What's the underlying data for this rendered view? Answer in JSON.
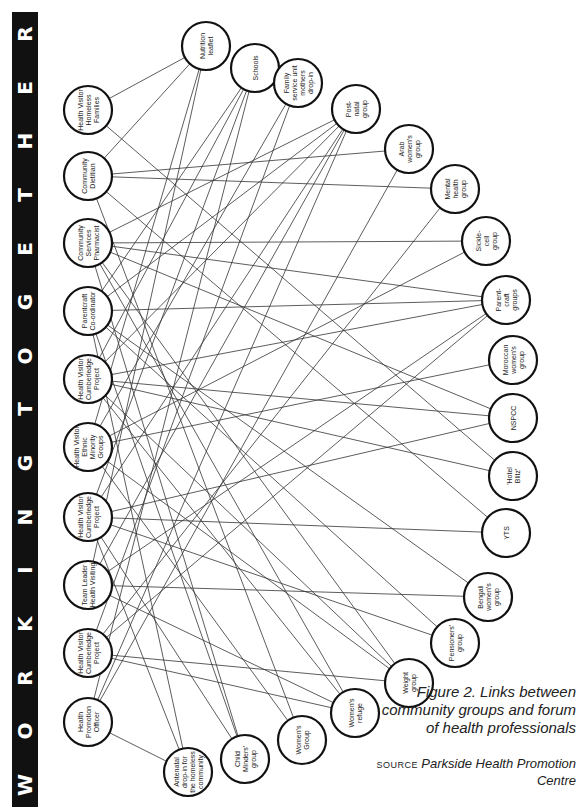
{
  "banner": {
    "title": "WORKING TOGETHER",
    "letters": [
      "W",
      "O",
      "R",
      "K",
      "I",
      "N",
      "G",
      "T",
      "O",
      "G",
      "E",
      "T",
      "H",
      "E",
      "R"
    ],
    "background": "#111111",
    "color": "#ffffff"
  },
  "diagram": {
    "professionals": [
      {
        "id": "p1",
        "label": [
          "Health Visitor",
          "Homeless",
          "Families"
        ],
        "x": 88,
        "y": 110
      },
      {
        "id": "p2",
        "label": [
          "Community",
          "Dietitian"
        ],
        "x": 88,
        "y": 176
      },
      {
        "id": "p3",
        "label": [
          "Community",
          "Services",
          "Pharmacist"
        ],
        "x": 88,
        "y": 243
      },
      {
        "id": "p4",
        "label": [
          "Parentcraft",
          "Co-ordinator"
        ],
        "x": 88,
        "y": 311
      },
      {
        "id": "p5",
        "label": [
          "Health Visitor",
          "Cumberledge",
          "Project"
        ],
        "x": 88,
        "y": 379
      },
      {
        "id": "p6",
        "label": [
          "Health Visitor",
          "Ethnic",
          "Minority",
          "Groups"
        ],
        "x": 88,
        "y": 447
      },
      {
        "id": "p7",
        "label": [
          "Health Visitor",
          "Cumberledge",
          "Project"
        ],
        "x": 88,
        "y": 517
      },
      {
        "id": "p8",
        "label": [
          "Team Leader",
          "Health Visiting"
        ],
        "x": 88,
        "y": 585
      },
      {
        "id": "p9",
        "label": [
          "Health Visitor",
          "Cumberledge",
          "Project"
        ],
        "x": 88,
        "y": 653
      },
      {
        "id": "p10",
        "label": [
          "Health",
          "Promotion",
          "Officer"
        ],
        "x": 88,
        "y": 722
      }
    ],
    "groups": [
      {
        "id": "g1",
        "label": [
          "Nutrition",
          "leaflet"
        ],
        "x": 206,
        "y": 46
      },
      {
        "id": "g2",
        "label": [
          "Schools"
        ],
        "x": 255,
        "y": 68
      },
      {
        "id": "g3",
        "label": [
          "Family",
          "service unit",
          "mothers",
          "drop-in"
        ],
        "x": 298,
        "y": 83
      },
      {
        "id": "g4",
        "label": [
          "Post-",
          "natal",
          "group"
        ],
        "x": 356,
        "y": 109
      },
      {
        "id": "g5",
        "label": [
          "Arab",
          "women's",
          "group"
        ],
        "x": 409,
        "y": 149
      },
      {
        "id": "g6",
        "label": [
          "Mental",
          "health",
          "group"
        ],
        "x": 455,
        "y": 189
      },
      {
        "id": "g7",
        "label": [
          "Sickle-",
          "cell",
          "group"
        ],
        "x": 486,
        "y": 241
      },
      {
        "id": "g8",
        "label": [
          "Parent-",
          "craft",
          "groups"
        ],
        "x": 506,
        "y": 300
      },
      {
        "id": "g9",
        "label": [
          "Moroccan",
          "women's",
          "group"
        ],
        "x": 513,
        "y": 360
      },
      {
        "id": "g10",
        "label": [
          "NSPCC"
        ],
        "x": 513,
        "y": 418
      },
      {
        "id": "g11",
        "label": [
          "'Hotel",
          "Blitz'"
        ],
        "x": 513,
        "y": 476
      },
      {
        "id": "g12",
        "label": [
          "YTS"
        ],
        "x": 506,
        "y": 533
      },
      {
        "id": "g13",
        "label": [
          "Bengali",
          "women's",
          "group"
        ],
        "x": 488,
        "y": 597
      },
      {
        "id": "g14",
        "label": [
          "Pensioners'",
          "group"
        ],
        "x": 455,
        "y": 643
      },
      {
        "id": "g15",
        "label": [
          "Weight",
          "group"
        ],
        "x": 409,
        "y": 683
      },
      {
        "id": "g16",
        "label": [
          "Women's",
          "refuge"
        ],
        "x": 355,
        "y": 713
      },
      {
        "id": "g17",
        "label": [
          "Women's",
          "Group"
        ],
        "x": 302,
        "y": 740
      },
      {
        "id": "g18",
        "label": [
          "Child",
          "Minders'",
          "group"
        ],
        "x": 245,
        "y": 759
      },
      {
        "id": "g19",
        "label": [
          "Antenatal",
          "drop-in for",
          "the homeless",
          "community"
        ],
        "x": 188,
        "y": 772
      }
    ],
    "edges": [
      [
        "p1",
        "g1"
      ],
      [
        "p1",
        "g11"
      ],
      [
        "p2",
        "g1"
      ],
      [
        "p2",
        "g6"
      ],
      [
        "p2",
        "g5"
      ],
      [
        "p2",
        "g12"
      ],
      [
        "p2",
        "g17"
      ],
      [
        "p3",
        "g4"
      ],
      [
        "p3",
        "g7"
      ],
      [
        "p3",
        "g8"
      ],
      [
        "p3",
        "g10"
      ],
      [
        "p3",
        "g15"
      ],
      [
        "p3",
        "g18"
      ],
      [
        "p3",
        "g16"
      ],
      [
        "p4",
        "g2"
      ],
      [
        "p4",
        "g4"
      ],
      [
        "p4",
        "g8"
      ],
      [
        "p4",
        "g13"
      ],
      [
        "p4",
        "g19"
      ],
      [
        "p4",
        "g14"
      ],
      [
        "p4",
        "g18"
      ],
      [
        "p5",
        "g2"
      ],
      [
        "p5",
        "g4"
      ],
      [
        "p5",
        "g8"
      ],
      [
        "p5",
        "g10"
      ],
      [
        "p5",
        "g11"
      ],
      [
        "p5",
        "g16"
      ],
      [
        "p5",
        "g15"
      ],
      [
        "p6",
        "g1"
      ],
      [
        "p6",
        "g3"
      ],
      [
        "p6",
        "g9"
      ],
      [
        "p6",
        "g7"
      ],
      [
        "p6",
        "g15"
      ],
      [
        "p6",
        "g17"
      ],
      [
        "p7",
        "g2"
      ],
      [
        "p7",
        "g4"
      ],
      [
        "p7",
        "g12"
      ],
      [
        "p7",
        "g10"
      ],
      [
        "p7",
        "g14"
      ],
      [
        "p7",
        "g19"
      ],
      [
        "p7",
        "g18"
      ],
      [
        "p8",
        "g1"
      ],
      [
        "p8",
        "g4"
      ],
      [
        "p8",
        "g13"
      ],
      [
        "p8",
        "g16"
      ],
      [
        "p8",
        "g8"
      ],
      [
        "p9",
        "g3"
      ],
      [
        "p9",
        "g6"
      ],
      [
        "p9",
        "g8"
      ],
      [
        "p9",
        "g15"
      ],
      [
        "p9",
        "g16"
      ],
      [
        "p10",
        "g2"
      ],
      [
        "p10",
        "g4"
      ],
      [
        "p10",
        "g19"
      ],
      [
        "p10",
        "g5"
      ]
    ],
    "node_radius": 24,
    "stroke_color": "#111111",
    "edge_color": "#333333"
  },
  "caption": {
    "figure": "Figure 2.  Links between community groups and forum of health professionals",
    "source_label": "SOURCE",
    "source_org": "Parkside Health Promotion Centre"
  }
}
